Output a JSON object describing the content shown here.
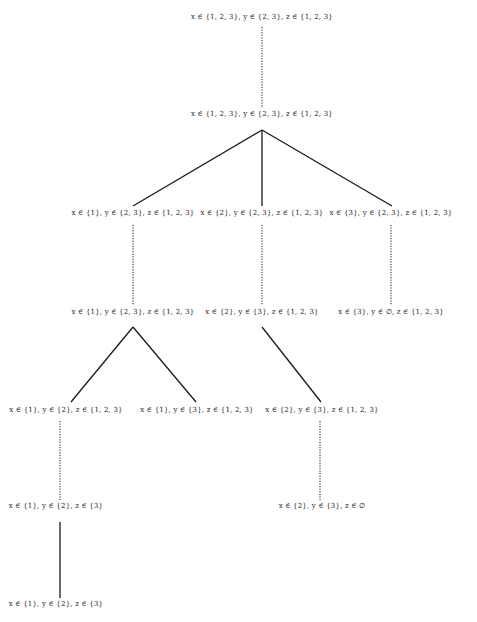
{
  "diagram": {
    "type": "search-tree",
    "nodes": [
      {
        "id": "n0",
        "label": "x ∈ {1, 2, 3}, y ∈ {2, 3}, z ∈ {1, 2, 3}",
        "x": 262,
        "y": 18
      },
      {
        "id": "n1",
        "label": "x ∈ {1, 2, 3}, y ∈ {2, 3}, z ∈ {1, 2, 3}",
        "x": 262,
        "y": 115
      },
      {
        "id": "n2",
        "label": "x ∈ {1}, y ∈ {2, 3}, z ∈ {1, 2, 3}",
        "x": 133,
        "y": 214
      },
      {
        "id": "n3",
        "label": "x ∈ {2}, y ∈ {2, 3}, z ∈ {1, 2, 3}",
        "x": 262,
        "y": 214
      },
      {
        "id": "n4",
        "label": "x ∈ {3}, y ∈ {2, 3}, z ∈ {1, 2, 3}",
        "x": 391,
        "y": 214
      },
      {
        "id": "n5",
        "label": "x ∈ {1}, y ∈ {2, 3}, z ∈ {1, 2, 3}",
        "x": 133,
        "y": 313
      },
      {
        "id": "n6",
        "label": "x ∈ {2}, y ∈ {3}, z ∈ {1, 2, 3}",
        "x": 262,
        "y": 313
      },
      {
        "id": "n7",
        "label": "x ∈ {3}, y ∈ ∅, z ∈ {1, 2, 3}",
        "x": 391,
        "y": 313
      },
      {
        "id": "n8",
        "label": "x ∈ {1}, y ∈ {2}, z ∈ {1, 2, 3}",
        "x": 66,
        "y": 411
      },
      {
        "id": "n9",
        "label": "x ∈ {1}, y ∈ {3}, z ∈ {1, 2, 3}",
        "x": 197,
        "y": 411
      },
      {
        "id": "n10",
        "label": "x ∈ {2}, y ∈ {3}, z ∈ {1, 2, 3}",
        "x": 322,
        "y": 411
      },
      {
        "id": "n11",
        "label": "x ∈ {1}, y ∈ {2}, z ∈ {3}",
        "x": 56,
        "y": 507
      },
      {
        "id": "n12",
        "label": "x ∈ {2}, y ∈ {3}, z ∈ ∅",
        "x": 322,
        "y": 507
      },
      {
        "id": "n13",
        "label": "x ∈ {1}, y ∈ {2}, z ∈ {3}",
        "x": 56,
        "y": 605
      }
    ],
    "edges": [
      {
        "from": "n0",
        "to": "n1",
        "style": "dotted",
        "x1": 262,
        "y1": 27,
        "x2": 262,
        "y2": 108
      },
      {
        "from": "n1",
        "to": "n2",
        "style": "solid",
        "x1": 262,
        "y1": 130,
        "x2": 133,
        "y2": 206
      },
      {
        "from": "n1",
        "to": "n3",
        "style": "solid",
        "x1": 262,
        "y1": 130,
        "x2": 262,
        "y2": 206
      },
      {
        "from": "n1",
        "to": "n4",
        "style": "solid",
        "x1": 262,
        "y1": 130,
        "x2": 392,
        "y2": 206
      },
      {
        "from": "n2",
        "to": "n5",
        "style": "dotted",
        "x1": 133,
        "y1": 225,
        "x2": 133,
        "y2": 305
      },
      {
        "from": "n3",
        "to": "n6",
        "style": "dotted",
        "x1": 262,
        "y1": 225,
        "x2": 262,
        "y2": 305
      },
      {
        "from": "n4",
        "to": "n7",
        "style": "dotted",
        "x1": 391,
        "y1": 225,
        "x2": 391,
        "y2": 305
      },
      {
        "from": "n5",
        "to": "n8",
        "style": "solid",
        "x1": 133,
        "y1": 327,
        "x2": 71,
        "y2": 402
      },
      {
        "from": "n5",
        "to": "n9",
        "style": "solid",
        "x1": 133,
        "y1": 327,
        "x2": 196,
        "y2": 402
      },
      {
        "from": "n6",
        "to": "n10",
        "style": "solid",
        "x1": 262,
        "y1": 327,
        "x2": 321,
        "y2": 402
      },
      {
        "from": "n8",
        "to": "n11",
        "style": "dotted",
        "x1": 60,
        "y1": 421,
        "x2": 60,
        "y2": 500
      },
      {
        "from": "n10",
        "to": "n12",
        "style": "dotted",
        "x1": 320,
        "y1": 421,
        "x2": 320,
        "y2": 500
      },
      {
        "from": "n11",
        "to": "n13",
        "style": "solid",
        "x1": 60,
        "y1": 522,
        "x2": 60,
        "y2": 598
      }
    ]
  },
  "colors": {
    "line": "#1a1a1a",
    "text": "#222222",
    "background": "#ffffff"
  }
}
